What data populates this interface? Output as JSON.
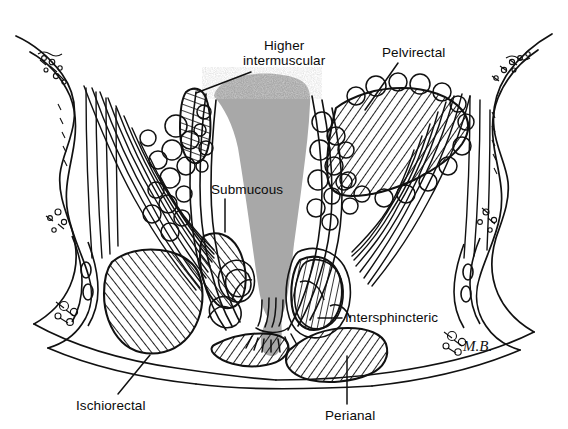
{
  "figure": {
    "kind": "anatomical-illustration",
    "artist_signature": "M.B.",
    "background_color": "#ffffff",
    "ink_color": "#111111",
    "lumen_fill_color": "#a8a8a8",
    "hatch_color": "#141414"
  },
  "labels": [
    {
      "id": "higher-intermuscular",
      "line1": "Higher",
      "line2": "intermuscular",
      "x": 243,
      "y": 38,
      "leader": {
        "x1": 251,
        "y1": 72,
        "x2": 196,
        "y2": 93
      }
    },
    {
      "id": "pelvirectal",
      "line1": "Pelvirectal",
      "line2": "",
      "x": 382,
      "y": 45,
      "leader": {
        "x1": 398,
        "y1": 63,
        "x2": 365,
        "y2": 110
      }
    },
    {
      "id": "submucous",
      "line1": "Submucous",
      "line2": "",
      "x": 211,
      "y": 182,
      "leader": {
        "x1": 225,
        "y1": 199,
        "x2": 225,
        "y2": 232
      }
    },
    {
      "id": "intersphincteric",
      "line1": "Intersphincteric",
      "line2": "",
      "x": 345,
      "y": 310,
      "leader": {
        "x1": 342,
        "y1": 318,
        "x2": 318,
        "y2": 318
      }
    },
    {
      "id": "ischiorectal",
      "line1": "Ischiorectal",
      "line2": "",
      "x": 76,
      "y": 398,
      "leader": {
        "x1": 118,
        "y1": 394,
        "x2": 150,
        "y2": 355
      }
    },
    {
      "id": "perianal",
      "line1": "Perianal",
      "line2": "",
      "x": 325,
      "y": 408,
      "leader": {
        "x1": 347,
        "y1": 404,
        "x2": 347,
        "y2": 356
      }
    }
  ],
  "regions": [
    {
      "id": "lumen",
      "name": "rectal-anal-lumen",
      "fill": "#a8a8a8"
    },
    {
      "id": "pelvirectal-space",
      "name": "pelvirectal-abscess-space",
      "pattern": "diagonal-hatch"
    },
    {
      "id": "ischiorectal-space",
      "name": "ischiorectal-abscess-space",
      "pattern": "diagonal-hatch"
    },
    {
      "id": "perianal-space",
      "name": "perianal-abscess-space",
      "pattern": "diagonal-hatch"
    },
    {
      "id": "intersphincteric-space",
      "name": "intersphincteric-abscess-space",
      "pattern": "diagonal-hatch"
    },
    {
      "id": "higher-intermuscular-space",
      "name": "higher-intermuscular-abscess-space",
      "pattern": "diagonal-hatch"
    },
    {
      "id": "submucous-space",
      "name": "submucous-abscess-space",
      "pattern": "diagonal-hatch"
    }
  ]
}
